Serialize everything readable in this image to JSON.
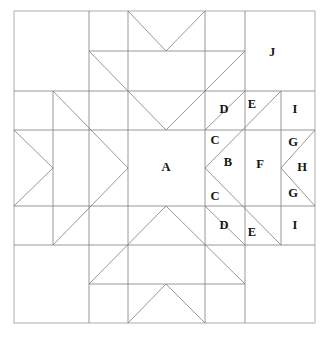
{
  "diagram": {
    "type": "quilt-block-line-drawing",
    "canvas": {
      "width": 329,
      "height": 342
    },
    "block_bounds": {
      "x": 14,
      "y": 11,
      "width": 301,
      "height": 312
    },
    "colors": {
      "background": "#ffffff",
      "line": "#777777",
      "border": "#909090",
      "label_text": "#141414"
    },
    "line_width": 0.8,
    "labels": [
      {
        "id": "A",
        "text": "A",
        "x": 166,
        "y": 168,
        "piece": "center-square"
      },
      {
        "id": "B",
        "text": "B",
        "x": 228,
        "y": 163,
        "piece": "small-triangle-right"
      },
      {
        "id": "C1",
        "text": "C",
        "x": 215,
        "y": 141,
        "piece": "triangle-upper-inner"
      },
      {
        "id": "C2",
        "text": "C",
        "x": 215,
        "y": 197,
        "piece": "triangle-lower-inner"
      },
      {
        "id": "D1",
        "text": "D",
        "x": 224,
        "y": 110,
        "piece": "triangle-upper-outer"
      },
      {
        "id": "D2",
        "text": "D",
        "x": 224,
        "y": 226,
        "piece": "triangle-lower-outer"
      },
      {
        "id": "E1",
        "text": "E",
        "x": 252,
        "y": 105,
        "piece": "sliver-upper"
      },
      {
        "id": "E2",
        "text": "E",
        "x": 252,
        "y": 233,
        "piece": "sliver-lower"
      },
      {
        "id": "F",
        "text": "F",
        "x": 260,
        "y": 165,
        "piece": "large-center-triangle"
      },
      {
        "id": "G1",
        "text": "G",
        "x": 293,
        "y": 143,
        "piece": "small-triangle-upper-right"
      },
      {
        "id": "G2",
        "text": "G",
        "x": 293,
        "y": 194,
        "piece": "small-triangle-lower-right"
      },
      {
        "id": "H",
        "text": "H",
        "x": 302,
        "y": 168,
        "piece": "triangle-far-right"
      },
      {
        "id": "I1",
        "text": "I",
        "x": 295,
        "y": 110,
        "piece": "corner-square-upper-right"
      },
      {
        "id": "I2",
        "text": "I",
        "x": 295,
        "y": 226,
        "piece": "corner-square-lower-right"
      },
      {
        "id": "J",
        "text": "J",
        "x": 272,
        "y": 53,
        "piece": "corner-square-large"
      }
    ],
    "grid": {
      "vertical_x": [
        14,
        89,
        128,
        205,
        245,
        281,
        315
      ],
      "horizontal_y": [
        11,
        51,
        91,
        130,
        168,
        206,
        245,
        284,
        323
      ]
    }
  }
}
